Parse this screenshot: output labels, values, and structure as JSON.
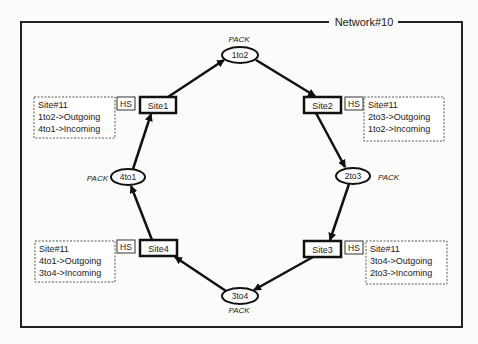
{
  "network": {
    "title": "Network#10"
  },
  "places": [
    {
      "id": "1to2",
      "label": "1to2",
      "type_label": "PACK"
    },
    {
      "id": "2to3",
      "label": "2to3",
      "type_label": "PACK"
    },
    {
      "id": "3to4",
      "label": "3to4",
      "type_label": "PACK"
    },
    {
      "id": "4to1",
      "label": "4to1",
      "type_label": "PACK"
    }
  ],
  "transitions": [
    {
      "id": "Site1",
      "label": "Site1",
      "hs_label": "HS",
      "info": {
        "title": "Site#11",
        "lines": [
          "1to2->Outgoing",
          "4to1->Incoming"
        ]
      }
    },
    {
      "id": "Site2",
      "label": "Site2",
      "hs_label": "HS",
      "info": {
        "title": "Site#11",
        "lines": [
          "2to3->Outgoing",
          "1to2->Incoming"
        ]
      }
    },
    {
      "id": "Site3",
      "label": "Site3",
      "hs_label": "HS",
      "info": {
        "title": "Site#11",
        "lines": [
          "3to4->Outgoing",
          "2to3->Incoming"
        ]
      }
    },
    {
      "id": "Site4",
      "label": "Site4",
      "hs_label": "HS",
      "info": {
        "title": "Site#11",
        "lines": [
          "4to1->Outgoing",
          "3to4->Incoming"
        ]
      }
    }
  ],
  "arcs": [
    {
      "from": "Site1",
      "to": "1to2"
    },
    {
      "from": "1to2",
      "to": "Site2"
    },
    {
      "from": "Site2",
      "to": "2to3"
    },
    {
      "from": "2to3",
      "to": "Site3"
    },
    {
      "from": "Site3",
      "to": "3to4"
    },
    {
      "from": "3to4",
      "to": "Site4"
    },
    {
      "from": "Site4",
      "to": "4to1"
    },
    {
      "from": "4to1",
      "to": "Site1"
    }
  ]
}
